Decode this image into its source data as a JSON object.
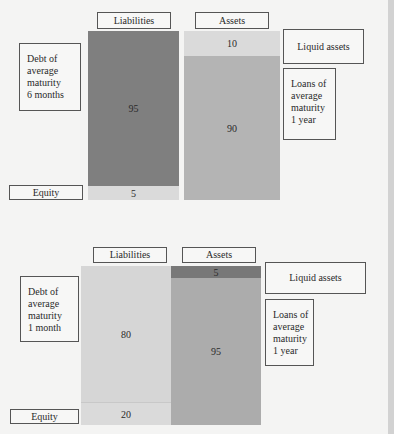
{
  "diagrams": [
    {
      "headers": {
        "liabilities": "Liabilities",
        "assets": "Assets"
      },
      "liabilities": {
        "debt": {
          "value": "95",
          "label": "Debt of\naverage\nmaturity\n6 months"
        },
        "equity": {
          "value": "5",
          "label": "Equity"
        }
      },
      "assets": {
        "liquid": {
          "value": "10",
          "label": "Liquid assets"
        },
        "loans": {
          "value": "90",
          "label": "Loans of\naverage\nmaturity\n1 year"
        }
      }
    },
    {
      "headers": {
        "liabilities": "Liabilities",
        "assets": "Assets"
      },
      "liabilities": {
        "debt": {
          "value": "80",
          "label": "Debt of\naverage\nmaturity\n1 month"
        },
        "equity": {
          "value": "20",
          "label": "Equity"
        }
      },
      "assets": {
        "liquid": {
          "value": "5",
          "label": "Liquid assets"
        },
        "loans": {
          "value": "95",
          "label": "Loans of\naverage\nmaturity\n1 year"
        }
      }
    }
  ],
  "colors": {
    "dark_segment": "#7f7f7f",
    "mid_segment": "#b4b4b4",
    "light_segment": "#dadada",
    "background": "#f4f4f3"
  }
}
